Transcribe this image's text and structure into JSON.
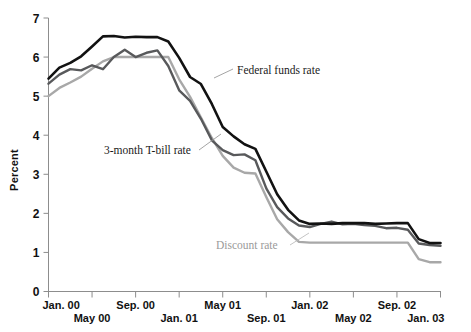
{
  "chart_data": {
    "type": "line",
    "title": "",
    "xlabel": "",
    "ylabel": "Percent",
    "ylim": [
      0,
      7
    ],
    "yticks": [
      0,
      1,
      2,
      3,
      4,
      5,
      6,
      7
    ],
    "ytick_labels": [
      "0",
      "1",
      "2",
      "3",
      "4",
      "5",
      "6",
      "7"
    ],
    "grid": false,
    "legend_position": "inline-annotations",
    "x": [
      "Jan. 00",
      "Feb. 00",
      "Mar. 00",
      "Apr. 00",
      "May 00",
      "Jun. 00",
      "Jul. 00",
      "Aug. 00",
      "Sep. 00",
      "Oct. 00",
      "Nov. 00",
      "Dec. 00",
      "Jan. 01",
      "Feb. 01",
      "Mar. 01",
      "Apr. 01",
      "May 01",
      "Jun. 01",
      "Jul. 01",
      "Aug. 01",
      "Sep. 01",
      "Oct. 01",
      "Nov. 01",
      "Dec. 01",
      "Jan. 02",
      "Feb. 02",
      "Mar. 02",
      "Apr. 02",
      "May 02",
      "Jun. 02",
      "Jul. 02",
      "Aug. 02",
      "Sep. 02",
      "Oct. 02",
      "Nov. 02",
      "Dec. 02",
      "Jan. 03"
    ],
    "xtick_labels": [
      "Jan. 00",
      "May 00",
      "Sep. 00",
      "Jan. 01",
      "May 01",
      "Sep. 01",
      "Jan. 02",
      "May 02",
      "Sep. 02",
      "Jan. 03"
    ],
    "xtick_indices": [
      0,
      4,
      8,
      12,
      16,
      20,
      24,
      28,
      32,
      36
    ],
    "series": [
      {
        "name": "Federal funds rate",
        "color": "#121212",
        "width": 2.6,
        "values": [
          5.45,
          5.73,
          5.85,
          6.02,
          6.27,
          6.53,
          6.54,
          6.5,
          6.52,
          6.51,
          6.51,
          6.4,
          5.98,
          5.49,
          5.31,
          4.8,
          4.21,
          3.97,
          3.77,
          3.65,
          3.07,
          2.49,
          2.09,
          1.82,
          1.73,
          1.74,
          1.73,
          1.75,
          1.75,
          1.75,
          1.73,
          1.74,
          1.75,
          1.75,
          1.34,
          1.24,
          1.24
        ]
      },
      {
        "name": "3-month T-bill rate",
        "color": "#58595b",
        "width": 2.4,
        "values": [
          5.32,
          5.55,
          5.69,
          5.66,
          5.79,
          5.69,
          6.0,
          6.19,
          6.0,
          6.11,
          6.17,
          5.77,
          5.15,
          4.88,
          4.42,
          3.87,
          3.62,
          3.49,
          3.51,
          3.36,
          2.64,
          2.16,
          1.87,
          1.69,
          1.65,
          1.73,
          1.79,
          1.72,
          1.73,
          1.7,
          1.68,
          1.62,
          1.63,
          1.58,
          1.23,
          1.19,
          1.17
        ]
      },
      {
        "name": "Discount rate",
        "color": "#a8a8a8",
        "width": 2.4,
        "values": [
          5.0,
          5.21,
          5.35,
          5.5,
          5.7,
          5.89,
          6.0,
          6.0,
          6.0,
          6.0,
          6.0,
          6.0,
          5.43,
          4.98,
          4.45,
          3.93,
          3.47,
          3.17,
          3.04,
          3.02,
          2.42,
          1.85,
          1.52,
          1.27,
          1.25,
          1.25,
          1.25,
          1.25,
          1.25,
          1.25,
          1.25,
          1.25,
          1.25,
          1.25,
          0.83,
          0.75,
          0.75
        ]
      }
    ],
    "annotations": [
      {
        "text": "Federal funds rate",
        "color": "#1a1a1a"
      },
      {
        "text": "3-month T-bill rate",
        "color": "#1a1a1a"
      },
      {
        "text": "Discount rate",
        "color": "#9a9a9a"
      }
    ]
  }
}
